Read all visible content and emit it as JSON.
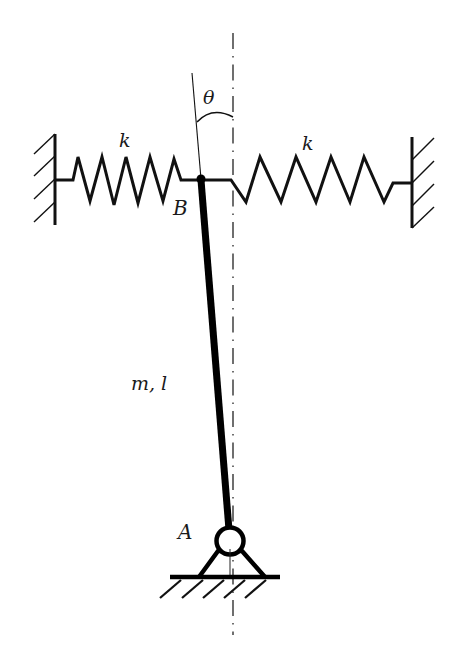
{
  "diagram": {
    "type": "mechanics-schematic",
    "labels": {
      "angle": "θ",
      "spring_left": "k",
      "spring_right": "k",
      "point_top": "B",
      "point_base": "A",
      "rod_params": "m, l"
    },
    "colors": {
      "ink": "#111111",
      "background": "#ffffff"
    },
    "components": [
      {
        "name": "left-wall",
        "kind": "fixed-support"
      },
      {
        "name": "left-spring",
        "kind": "spring",
        "stiffness_label": "k"
      },
      {
        "name": "rod",
        "kind": "rigid-bar",
        "params": "m, l"
      },
      {
        "name": "right-spring",
        "kind": "spring",
        "stiffness_label": "k"
      },
      {
        "name": "right-wall",
        "kind": "fixed-support"
      },
      {
        "name": "pin-support",
        "kind": "pinned-joint",
        "label": "A"
      },
      {
        "name": "vertical-axis",
        "kind": "centerline"
      },
      {
        "name": "angle-arc",
        "kind": "angle",
        "label": "θ"
      }
    ]
  }
}
